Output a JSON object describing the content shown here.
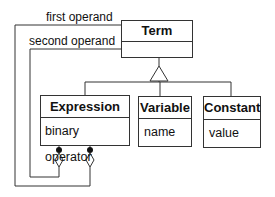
{
  "diagram": {
    "type": "uml-class-diagram",
    "classes": [
      {
        "id": "term",
        "name": "Term",
        "attributes": ""
      },
      {
        "id": "expression",
        "name": "Expression",
        "attributes": "binary operator"
      },
      {
        "id": "variable",
        "name": "Variable",
        "attributes": "name"
      },
      {
        "id": "constant",
        "name": "Constant",
        "attributes": "value"
      }
    ],
    "associations": [
      {
        "label": "first operand",
        "from": "expression",
        "to": "term",
        "kind": "aggregation"
      },
      {
        "label": "second operand",
        "from": "expression",
        "to": "term",
        "kind": "aggregation"
      }
    ],
    "generalization": {
      "parent": "term",
      "children": [
        "expression",
        "variable",
        "constant"
      ]
    }
  }
}
